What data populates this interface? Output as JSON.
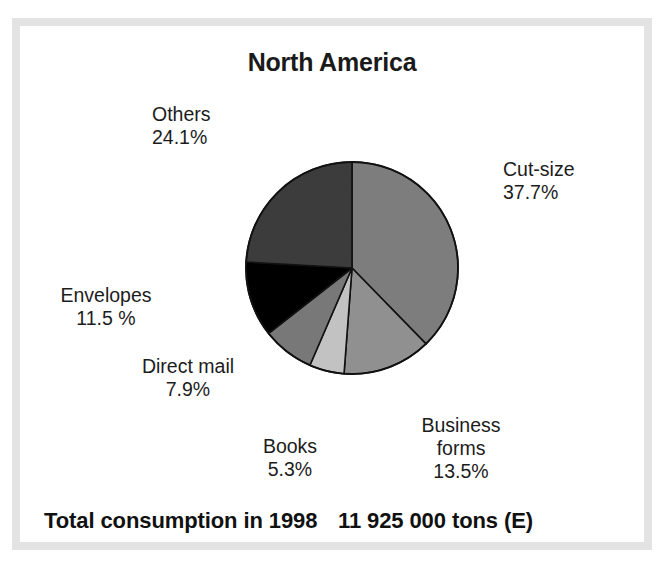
{
  "chart_data": {
    "type": "pie",
    "title": "North America",
    "categories": [
      "Cut-size",
      "Business forms",
      "Books",
      "Direct mail",
      "Envelopes",
      "Others"
    ],
    "values": [
      37.7,
      13.5,
      5.3,
      7.9,
      11.5,
      24.1
    ],
    "unit": "%",
    "start_angle_deg": 0,
    "direction": "clockwise",
    "legend": "none",
    "grid": false,
    "slices": [
      {
        "name": "Cut-size",
        "value": 37.7,
        "value_label": "37.7%",
        "color": "#7d7d7d"
      },
      {
        "name": "Business forms",
        "value": 13.5,
        "value_label": "13.5%",
        "color": "#909090"
      },
      {
        "name": "Books",
        "value": 5.3,
        "value_label": "5.3%",
        "color": "#c2c2c2"
      },
      {
        "name": "Direct mail",
        "value": 7.9,
        "value_label": "7.9%",
        "color": "#787878"
      },
      {
        "name": "Envelopes",
        "value": 11.5,
        "value_label": "11.5 %",
        "color": "#000000"
      },
      {
        "name": "Others",
        "value": 24.1,
        "value_label": "24.1%",
        "color": "#3c3c3c"
      }
    ],
    "annotations": {
      "total_label": "Total consumption in 1998",
      "total_value": "11 925 000 tons (E)"
    }
  },
  "title": "North America",
  "labels": {
    "others": {
      "name": "Others",
      "pct": "24.1%"
    },
    "cutsize": {
      "name": "Cut-size",
      "pct": "37.7%"
    },
    "envelopes": {
      "name": "Envelopes",
      "pct": "11.5 %"
    },
    "directmail": {
      "name": "Direct mail",
      "pct": "7.9%"
    },
    "books": {
      "name": "Books",
      "pct": "5.3%"
    },
    "busforms": {
      "name": "Business",
      "name2": "forms",
      "pct": "13.5%"
    }
  },
  "footer": {
    "left": "Total consumption in 1998",
    "right": "11 925 000 tons (E)"
  },
  "colors": {
    "cutsize": "#7d7d7d",
    "busforms": "#909090",
    "books": "#c2c2c2",
    "directmail": "#787878",
    "envelopes": "#000000",
    "others": "#3c3c3c",
    "stroke": "#111111",
    "frame": "#e3e3e3",
    "background": "#ffffff",
    "text": "#1c1c1c"
  }
}
